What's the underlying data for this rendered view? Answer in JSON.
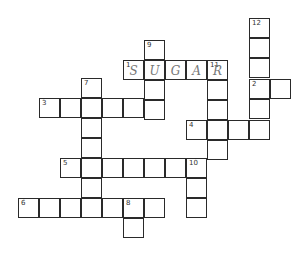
{
  "puzzle": {
    "type": "crossword",
    "cell_size": [
      21,
      20
    ],
    "cells": [
      {
        "x": 249,
        "y": 18,
        "num": "12",
        "letter": ""
      },
      {
        "x": 249,
        "y": 38,
        "num": "",
        "letter": ""
      },
      {
        "x": 249,
        "y": 58,
        "num": "",
        "letter": ""
      },
      {
        "x": 249,
        "y": 79,
        "num": "2",
        "letter": ""
      },
      {
        "x": 270,
        "y": 79,
        "num": "",
        "letter": ""
      },
      {
        "x": 249,
        "y": 99,
        "num": "",
        "letter": ""
      },
      {
        "x": 249,
        "y": 120,
        "num": "",
        "letter": ""
      },
      {
        "x": 144,
        "y": 40,
        "num": "9",
        "letter": ""
      },
      {
        "x": 123,
        "y": 60,
        "num": "1",
        "letter": "S"
      },
      {
        "x": 144,
        "y": 60,
        "num": "",
        "letter": "U"
      },
      {
        "x": 165,
        "y": 60,
        "num": "",
        "letter": "G"
      },
      {
        "x": 186,
        "y": 60,
        "num": "",
        "letter": "A"
      },
      {
        "x": 207,
        "y": 60,
        "num": "11",
        "letter": "R"
      },
      {
        "x": 144,
        "y": 80,
        "num": "",
        "letter": ""
      },
      {
        "x": 144,
        "y": 100,
        "num": "",
        "letter": ""
      },
      {
        "x": 207,
        "y": 80,
        "num": "",
        "letter": ""
      },
      {
        "x": 207,
        "y": 100,
        "num": "",
        "letter": ""
      },
      {
        "x": 207,
        "y": 120,
        "num": "",
        "letter": ""
      },
      {
        "x": 207,
        "y": 140,
        "num": "",
        "letter": ""
      },
      {
        "x": 81,
        "y": 78,
        "num": "7",
        "letter": ""
      },
      {
        "x": 39,
        "y": 98,
        "num": "3",
        "letter": ""
      },
      {
        "x": 60,
        "y": 98,
        "num": "",
        "letter": ""
      },
      {
        "x": 81,
        "y": 98,
        "num": "",
        "letter": ""
      },
      {
        "x": 102,
        "y": 98,
        "num": "",
        "letter": ""
      },
      {
        "x": 123,
        "y": 98,
        "num": "",
        "letter": ""
      },
      {
        "x": 81,
        "y": 118,
        "num": "",
        "letter": ""
      },
      {
        "x": 81,
        "y": 138,
        "num": "",
        "letter": ""
      },
      {
        "x": 81,
        "y": 158,
        "num": "",
        "letter": ""
      },
      {
        "x": 81,
        "y": 178,
        "num": "",
        "letter": ""
      },
      {
        "x": 186,
        "y": 120,
        "num": "4",
        "letter": ""
      },
      {
        "x": 228,
        "y": 120,
        "num": "",
        "letter": ""
      },
      {
        "x": 60,
        "y": 158,
        "num": "5",
        "letter": ""
      },
      {
        "x": 102,
        "y": 158,
        "num": "",
        "letter": ""
      },
      {
        "x": 123,
        "y": 158,
        "num": "",
        "letter": ""
      },
      {
        "x": 144,
        "y": 158,
        "num": "",
        "letter": ""
      },
      {
        "x": 165,
        "y": 158,
        "num": "",
        "letter": ""
      },
      {
        "x": 186,
        "y": 158,
        "num": "10",
        "letter": ""
      },
      {
        "x": 186,
        "y": 178,
        "num": "",
        "letter": ""
      },
      {
        "x": 186,
        "y": 198,
        "num": "",
        "letter": ""
      },
      {
        "x": 18,
        "y": 198,
        "num": "6",
        "letter": ""
      },
      {
        "x": 39,
        "y": 198,
        "num": "",
        "letter": ""
      },
      {
        "x": 60,
        "y": 198,
        "num": "",
        "letter": ""
      },
      {
        "x": 81,
        "y": 198,
        "num": "",
        "letter": ""
      },
      {
        "x": 102,
        "y": 198,
        "num": "",
        "letter": ""
      },
      {
        "x": 123,
        "y": 198,
        "num": "8",
        "letter": ""
      },
      {
        "x": 144,
        "y": 198,
        "num": "",
        "letter": ""
      },
      {
        "x": 123,
        "y": 218,
        "num": "",
        "letter": ""
      }
    ]
  }
}
